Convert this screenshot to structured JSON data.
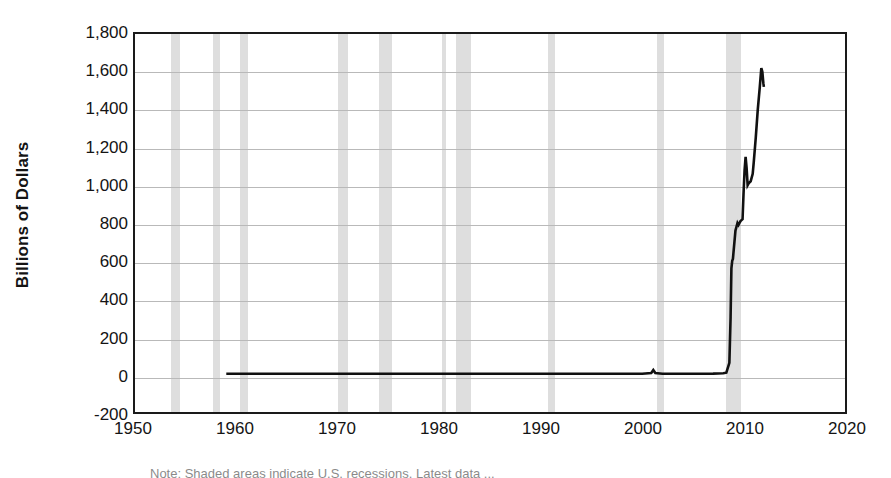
{
  "chart_data": {
    "type": "line",
    "title": "",
    "xlabel": "",
    "ylabel": "Billions of Dollars",
    "xlim": [
      1950,
      2020
    ],
    "ylim": [
      -200,
      1800
    ],
    "grid": true,
    "legend": "none",
    "xticks": [
      "1950",
      "1960",
      "1970",
      "1980",
      "1990",
      "2000",
      "2010",
      "2020"
    ],
    "xtick_values": [
      1950,
      1960,
      1970,
      1980,
      1990,
      2000,
      2010,
      2020
    ],
    "yticks": [
      "-200",
      "0",
      "200",
      "400",
      "600",
      "800",
      "1,000",
      "1,200",
      "1,400",
      "1,600",
      "1,800"
    ],
    "ytick_values": [
      -200,
      0,
      200,
      400,
      600,
      800,
      1000,
      1200,
      1400,
      1600,
      1800
    ],
    "series": [
      {
        "name": "Excess Reserves of Depository Institutions",
        "color": "#111111",
        "x": [
          1959.0,
          1960.0,
          1965.0,
          1970.0,
          1975.0,
          1980.0,
          1985.0,
          1990.0,
          1995.0,
          2000.0,
          2000.9,
          2001.1,
          2001.3,
          2002.0,
          2005.0,
          2007.0,
          2008.0,
          2008.3,
          2008.6,
          2008.72,
          2008.8,
          2008.88,
          2008.95,
          2009.0,
          2009.1,
          2009.2,
          2009.3,
          2009.4,
          2009.5,
          2009.6,
          2009.7,
          2009.8,
          2009.9,
          2010.0,
          2010.1,
          2010.2,
          2010.3,
          2010.4,
          2010.5,
          2010.7,
          2010.9,
          2011.0,
          2011.2,
          2011.4,
          2011.6,
          2011.75,
          2011.85,
          2011.95,
          2012.0
        ],
        "y": [
          2,
          2,
          2,
          2,
          2,
          2,
          2,
          2,
          2,
          2,
          6,
          22,
          6,
          2,
          2,
          3,
          5,
          8,
          60,
          300,
          560,
          600,
          610,
          640,
          700,
          760,
          780,
          800,
          790,
          800,
          810,
          815,
          820,
          960,
          1080,
          1150,
          1090,
          1000,
          1010,
          1020,
          1060,
          1120,
          1250,
          1400,
          1520,
          1620,
          1600,
          1540,
          1520
        ]
      }
    ],
    "recession_bands": [
      {
        "start": 1953.5,
        "end": 1954.4
      },
      {
        "start": 1957.6,
        "end": 1958.3
      },
      {
        "start": 1960.3,
        "end": 1961.1
      },
      {
        "start": 1969.9,
        "end": 1970.9
      },
      {
        "start": 1973.9,
        "end": 1975.2
      },
      {
        "start": 1980.1,
        "end": 1980.5
      },
      {
        "start": 1981.5,
        "end": 1982.9
      },
      {
        "start": 1990.5,
        "end": 1991.2
      },
      {
        "start": 2001.2,
        "end": 2001.9
      },
      {
        "start": 2007.95,
        "end": 2009.45
      }
    ],
    "colors": {
      "line": "#111111",
      "band": "#c9c9c9",
      "grid": "#b9b9b9",
      "axis": "#1a1a1a",
      "background": "#ffffff",
      "text": "#141414"
    }
  },
  "caption": {
    "text": "Note: Shaded areas indicate U.S. recessions. Latest data ..."
  }
}
